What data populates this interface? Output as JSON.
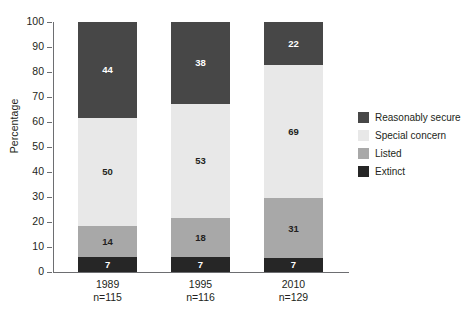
{
  "chart_data": {
    "type": "bar",
    "title": "",
    "subtitle": "",
    "xlabel": "",
    "ylabel": "Percentage",
    "ylim": [
      0,
      100
    ],
    "yticks": [
      0,
      10,
      20,
      30,
      40,
      50,
      60,
      70,
      80,
      90,
      100
    ],
    "grid": false,
    "stacked": true,
    "normalized_to_percent": true,
    "value_labels_are": "counts",
    "legend_position": "right",
    "categories": [
      "1989",
      "1995",
      "2010"
    ],
    "category_sublabels": [
      "n=115",
      "n=116",
      "n=129"
    ],
    "sample_sizes": [
      115,
      116,
      129
    ],
    "series": [
      {
        "name": "Reasonably secure",
        "color": "#474747",
        "label_color": "#ffffff",
        "values": [
          44,
          38,
          22
        ],
        "percents": [
          38.3,
          32.8,
          17.1
        ]
      },
      {
        "name": "Special concern",
        "color": "#e8e8e8",
        "label_color": "#231f20",
        "values": [
          50,
          53,
          69
        ],
        "percents": [
          43.5,
          45.7,
          53.5
        ]
      },
      {
        "name": "Listed",
        "color": "#a8a8a8",
        "label_color": "#231f20",
        "values": [
          14,
          18,
          31
        ],
        "percents": [
          12.2,
          15.5,
          24.0
        ]
      },
      {
        "name": "Extinct",
        "color": "#262626",
        "label_color": "#ffffff",
        "values": [
          7,
          7,
          7
        ],
        "percents": [
          6.1,
          6.0,
          5.4
        ]
      }
    ]
  },
  "axis": {
    "tick_labels": [
      "100",
      "90",
      "80",
      "70",
      "60",
      "50",
      "40",
      "30",
      "20",
      "10",
      "0"
    ],
    "y_title": "Percentage"
  },
  "legend": {
    "items": [
      {
        "label": "Reasonably secure",
        "color": "#474747"
      },
      {
        "label": "Special concern",
        "color": "#e8e8e8"
      },
      {
        "label": "Listed",
        "color": "#a8a8a8"
      },
      {
        "label": "Extinct",
        "color": "#262626"
      }
    ]
  },
  "colors": {
    "axis": "#6d6e71",
    "text": "#231f20",
    "background": "#ffffff"
  }
}
